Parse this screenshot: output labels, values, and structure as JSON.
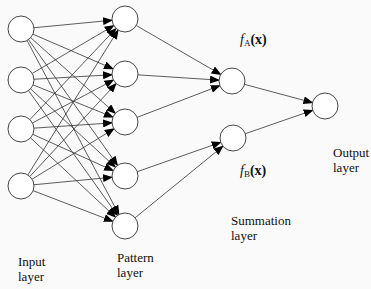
{
  "diagram": {
    "type": "probabilistic-neural-network",
    "layers": {
      "input": {
        "label": "Input\nlayer",
        "nodes": [
          [
            21,
            29
          ],
          [
            21,
            80
          ],
          [
            21,
            129
          ],
          [
            21,
            186
          ]
        ]
      },
      "pattern": {
        "label": "Pattern\nlayer",
        "nodes": [
          [
            125,
            19
          ],
          [
            125,
            74
          ],
          [
            125,
            122
          ],
          [
            125,
            176
          ],
          [
            125,
            226
          ]
        ]
      },
      "summation": {
        "label": "Summation\nlayer",
        "nodes": [
          [
            232,
            81
          ],
          [
            233,
            138
          ]
        ]
      },
      "output": {
        "label": "Output\nlayer",
        "nodes": [
          [
            325,
            106
          ]
        ]
      }
    },
    "node_radius": 13,
    "summation_labels": {
      "a": {
        "f": "f",
        "sub": "A",
        "arg": "(x)"
      },
      "b": {
        "f": "f",
        "sub": "B",
        "arg": "(x)"
      }
    },
    "pattern_to_summation": [
      [
        0,
        0
      ],
      [
        1,
        0
      ],
      [
        2,
        0
      ],
      [
        3,
        1
      ],
      [
        4,
        1
      ]
    ],
    "colors": {
      "stroke": "#333333",
      "arrow": "#000000",
      "node_fill": "#ffffff"
    }
  }
}
